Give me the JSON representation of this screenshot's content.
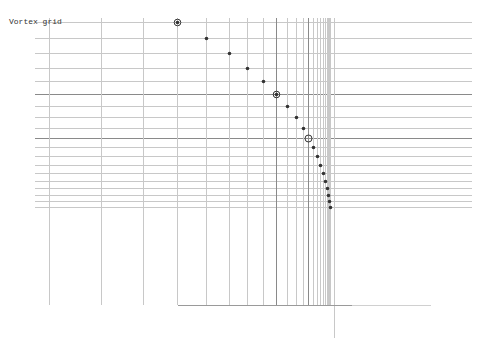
{
  "title": "Vortex grid",
  "colors": {
    "background": "#ffffff",
    "grid_light": "#c8c8c8",
    "grid_dark": "#8a8a8a",
    "dot": "#333333",
    "baseline_dark": "#9a9a9a",
    "baseline_light": "#d0d0d0"
  },
  "grid": {
    "h_x_start": 35,
    "h_x_end": 472,
    "h_lines": [
      {
        "y": 22,
        "weight": "light"
      },
      {
        "y": 38,
        "weight": "light"
      },
      {
        "y": 53,
        "weight": "light"
      },
      {
        "y": 68,
        "weight": "light"
      },
      {
        "y": 81,
        "weight": "light"
      },
      {
        "y": 94,
        "weight": "dark"
      },
      {
        "y": 106,
        "weight": "light"
      },
      {
        "y": 117,
        "weight": "light"
      },
      {
        "y": 128,
        "weight": "light"
      },
      {
        "y": 138,
        "weight": "dark"
      },
      {
        "y": 147,
        "weight": "light"
      },
      {
        "y": 156,
        "weight": "light"
      },
      {
        "y": 165,
        "weight": "light"
      },
      {
        "y": 173,
        "weight": "light"
      },
      {
        "y": 181,
        "weight": "light"
      },
      {
        "y": 188,
        "weight": "light"
      },
      {
        "y": 195,
        "weight": "light"
      },
      {
        "y": 201,
        "weight": "light"
      },
      {
        "y": 207,
        "weight": "light"
      }
    ],
    "v_y_start": 18,
    "v_y_end": 305,
    "v_lines": [
      {
        "x": 49,
        "weight": "light"
      },
      {
        "x": 101,
        "weight": "light"
      },
      {
        "x": 143,
        "weight": "light"
      },
      {
        "x": 177,
        "weight": "light"
      },
      {
        "x": 206,
        "weight": "light"
      },
      {
        "x": 229,
        "weight": "light"
      },
      {
        "x": 247,
        "weight": "light"
      },
      {
        "x": 263,
        "weight": "light"
      },
      {
        "x": 276,
        "weight": "dark"
      },
      {
        "x": 287,
        "weight": "light"
      },
      {
        "x": 296,
        "weight": "light"
      },
      {
        "x": 303,
        "weight": "light"
      },
      {
        "x": 308,
        "weight": "dark"
      },
      {
        "x": 313,
        "weight": "light"
      },
      {
        "x": 317,
        "weight": "light"
      },
      {
        "x": 320,
        "weight": "light"
      },
      {
        "x": 323,
        "weight": "light"
      },
      {
        "x": 325,
        "weight": "light"
      },
      {
        "x": 327,
        "weight": "light"
      },
      {
        "x": 328,
        "weight": "light"
      },
      {
        "x": 329,
        "weight": "light"
      },
      {
        "x": 330,
        "weight": "light"
      }
    ],
    "axis_vertical": {
      "x": 334,
      "y1": 18,
      "y2": 338
    },
    "baseline": {
      "y": 305,
      "x1": 178,
      "x_dark_end": 352,
      "x2": 431
    }
  },
  "points": [
    {
      "x": 177,
      "y": 22,
      "type": "ring-filled"
    },
    {
      "x": 206,
      "y": 38,
      "type": "dot"
    },
    {
      "x": 229,
      "y": 53,
      "type": "dot"
    },
    {
      "x": 247,
      "y": 68,
      "type": "dot"
    },
    {
      "x": 263,
      "y": 81,
      "type": "dot"
    },
    {
      "x": 276,
      "y": 94,
      "type": "ring-filled"
    },
    {
      "x": 287,
      "y": 106,
      "type": "dot"
    },
    {
      "x": 296,
      "y": 117,
      "type": "dot"
    },
    {
      "x": 303,
      "y": 128,
      "type": "dot"
    },
    {
      "x": 308,
      "y": 138,
      "type": "ring"
    },
    {
      "x": 313,
      "y": 147,
      "type": "dot"
    },
    {
      "x": 317,
      "y": 156,
      "type": "dot"
    },
    {
      "x": 320,
      "y": 165,
      "type": "dot"
    },
    {
      "x": 323,
      "y": 173,
      "type": "dot"
    },
    {
      "x": 325,
      "y": 181,
      "type": "dot"
    },
    {
      "x": 327,
      "y": 188,
      "type": "dot"
    },
    {
      "x": 328,
      "y": 195,
      "type": "dot"
    },
    {
      "x": 329,
      "y": 201,
      "type": "dot"
    },
    {
      "x": 330,
      "y": 207,
      "type": "dot"
    }
  ]
}
